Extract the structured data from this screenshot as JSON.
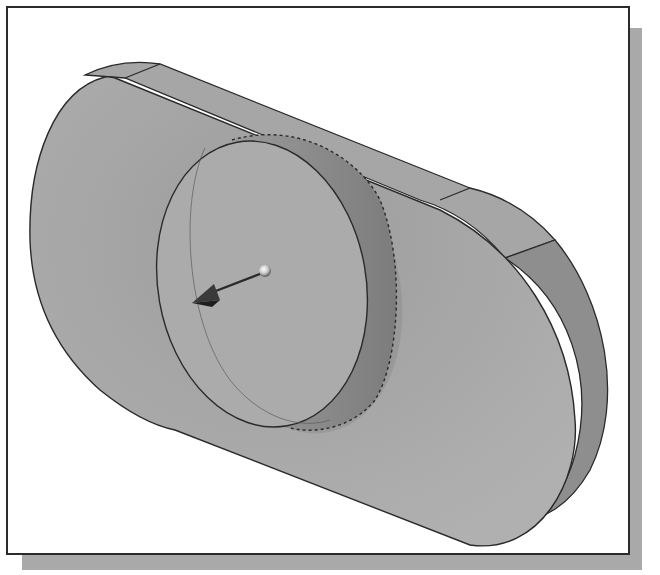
{
  "viewport": {
    "label": "3D model viewport",
    "model": "Slot-shaped plate with cylindrical boss",
    "colors": {
      "background": "#ffffff",
      "frame_border": "#2b2b2b",
      "frame_shadow": "#a9a9a9",
      "face_top": "#a8a8a8",
      "face_side": "#8e8e8e",
      "face_boss": "#ababab",
      "edge": "#2a2a2a"
    },
    "triad": {
      "icon": "direction-arrow-icon",
      "description": "Extrude direction arrow with sphere handle"
    }
  }
}
